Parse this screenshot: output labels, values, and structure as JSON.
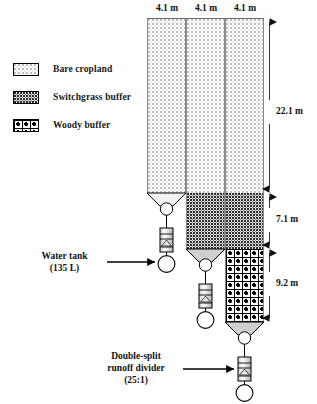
{
  "figure": {
    "type": "experimental-plot-schematic",
    "legend": {
      "items": [
        {
          "pattern": "bare-cropland-swatch",
          "label": "Bare cropland"
        },
        {
          "pattern": "switchgrass-buffer-swatch",
          "label": "Switchgrass buffer"
        },
        {
          "pattern": "woody-buffer-swatch",
          "label": "Woody buffer"
        }
      ]
    },
    "top_dimensions": [
      {
        "label": "4.1 m"
      },
      {
        "label": "4.1 m"
      },
      {
        "label": "4.1 m"
      }
    ],
    "side_dimensions": [
      {
        "label": "22.1 m",
        "segment": "bare cropland"
      },
      {
        "label": "7.1 m",
        "segment": "switchgrass buffer"
      },
      {
        "label": "9.2 m",
        "segment": "woody buffer"
      }
    ],
    "callouts": [
      {
        "name": "water-tank",
        "line1": "Water tank",
        "line2": "(135 L)",
        "line3": ""
      },
      {
        "name": "runoff-divider",
        "line1": "Double-split",
        "line2": "runoff divider",
        "line3": "(25:1)"
      }
    ],
    "plots": [
      {
        "id": "plot-1",
        "width_label": "4.1 m",
        "segments": [
          {
            "type": "bare",
            "length_label": "22.1 m"
          }
        ]
      },
      {
        "id": "plot-2",
        "width_label": "4.1 m",
        "segments": [
          {
            "type": "bare",
            "length_label": "22.1 m"
          },
          {
            "type": "switch",
            "length_label": "7.1 m"
          }
        ]
      },
      {
        "id": "plot-3",
        "width_label": "4.1 m",
        "segments": [
          {
            "type": "bare",
            "length_label": "22.1 m"
          },
          {
            "type": "switch",
            "length_label": "7.1 m"
          },
          {
            "type": "woody",
            "length_label": "9.2 m"
          }
        ]
      }
    ],
    "colors": {
      "outline": "#000000",
      "plot_border": "#8a8a8a",
      "dimension_line": "#3a3a3a",
      "text": "#111111"
    }
  }
}
